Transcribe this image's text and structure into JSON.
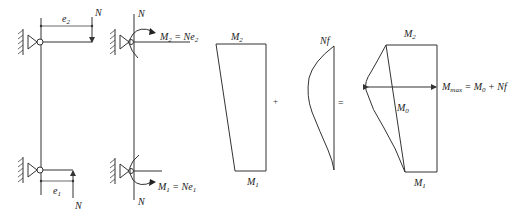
{
  "diagram": {
    "colors": {
      "stroke": "#333333",
      "text": "#222222",
      "background": "#ffffff"
    },
    "column_a": {
      "top_eccentricity_label": "e",
      "top_eccentricity_sub": "2",
      "top_load_label": "N",
      "bottom_eccentricity_label": "e",
      "bottom_eccentricity_sub": "1",
      "bottom_load_label": "N"
    },
    "column_b": {
      "top_load_label": "N",
      "top_moment_label": "M",
      "top_moment_sub": "2",
      "top_moment_eq": " = Ne",
      "top_moment_eq_sub": "2",
      "bottom_load_label": "N",
      "bottom_moment_label": "M",
      "bottom_moment_sub": "1",
      "bottom_moment_eq": " = Ne",
      "bottom_moment_eq_sub": "1"
    },
    "first_order_diagram": {
      "top_label": "M",
      "top_sub": "2",
      "bottom_label": "M",
      "bottom_sub": "1"
    },
    "operator_plus": "+",
    "second_order_diagram": {
      "label": "Nf"
    },
    "operator_equals": "=",
    "total_diagram": {
      "top_label": "M",
      "top_sub": "2",
      "bottom_label": "M",
      "bottom_sub": "1",
      "mid_label": "M",
      "mid_sub": "0",
      "max_label": "M",
      "max_sub": "max",
      "max_eq": " = M",
      "max_eq_sub": "0",
      "max_eq_tail": " + Nf"
    }
  }
}
